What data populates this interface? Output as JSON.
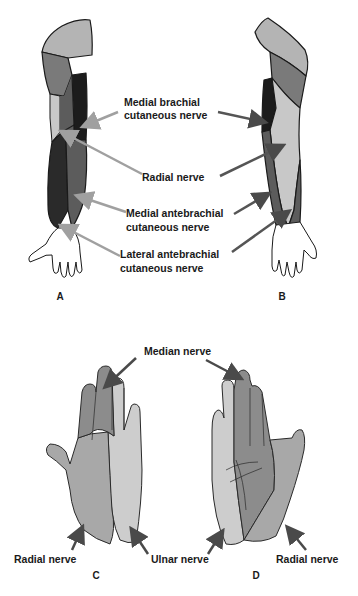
{
  "figure": {
    "panels": [
      {
        "id": "A",
        "label": "A",
        "view": "arm-anterior"
      },
      {
        "id": "B",
        "label": "B",
        "view": "arm-posterior"
      },
      {
        "id": "C",
        "label": "C",
        "view": "hand-dorsal"
      },
      {
        "id": "D",
        "label": "D",
        "view": "hand-palmar"
      }
    ],
    "arm_labels": [
      {
        "line1": "Medial brachial",
        "line2": "cutaneous nerve"
      },
      {
        "line1": "Radial nerve",
        "line2": ""
      },
      {
        "line1": "Medial antebrachial",
        "line2": "cutaneous nerve"
      },
      {
        "line1": "Lateral antebrachial",
        "line2": "cutaneous nerve"
      }
    ],
    "hand_labels": {
      "median": "Median nerve",
      "radial_left": "Radial nerve",
      "ulnar": "Ulnar nerve",
      "radial_right": "Radial nerve"
    },
    "colors": {
      "shoulder": "#b4b4b4",
      "upper_mid": "#7a7a7a",
      "dark": "#2a2a2a",
      "darker": "#1c1c1c",
      "forearm_mid": "#5c5c5c",
      "light": "#c8c8c8",
      "hand_dark": "#8c8c8c",
      "hand_mid": "#a8a8a8",
      "hand_light": "#cdcdcd",
      "arrow_gray": "#9a9a9a",
      "arrow_dark": "#4a4a4a"
    }
  }
}
